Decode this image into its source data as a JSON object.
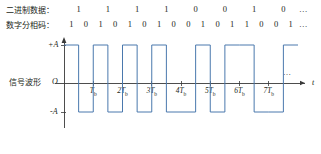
{
  "figure": {
    "title_row1_label": "二进制数据：",
    "title_row2_label": "数字分相码：",
    "waveform_label": "信号波形",
    "ellipsis": "…",
    "accent_color": "#4a78ad",
    "text_color": "#231f20"
  },
  "binary_data": {
    "label": "二进制数据：",
    "bits": [
      "1",
      "1",
      "1",
      "1",
      "0",
      "0",
      "1",
      "0"
    ],
    "trailing": "…"
  },
  "phase_code": {
    "label": "数字分相码：",
    "bits": [
      "1",
      "0",
      "1",
      "0",
      "1",
      "0",
      "1",
      "0",
      "0",
      "1",
      "0",
      "1",
      "1",
      "0",
      "0",
      "1"
    ],
    "trailing": "…"
  },
  "axes": {
    "origin_label": "O",
    "y_top_label": "+A",
    "y_bottom_label": "-A",
    "x_axis_label": "t",
    "x_ticks": [
      {
        "index": 1,
        "label": "T",
        "sub": "b"
      },
      {
        "index": 2,
        "label": "2T",
        "sub": "b"
      },
      {
        "index": 3,
        "label": "3T",
        "sub": "b"
      },
      {
        "index": 4,
        "label": "4T",
        "sub": "b"
      },
      {
        "index": 5,
        "label": "5T",
        "sub": "b"
      },
      {
        "index": 6,
        "label": "6T",
        "sub": "b"
      },
      {
        "index": 7,
        "label": "7T",
        "sub": "b"
      }
    ],
    "x_trailing": "…"
  },
  "chart_data": {
    "type": "line",
    "xlabel": "t",
    "ylabel": "",
    "ylim": [
      -1,
      1
    ],
    "y_tick_labels": [
      "+A",
      "O",
      "-A"
    ],
    "x_tick_labels": [
      "O",
      "Tb",
      "2Tb",
      "3Tb",
      "4Tb",
      "5Tb",
      "6Tb",
      "7Tb"
    ],
    "grid": false,
    "legend": "none",
    "bit_period": 1,
    "levels": {
      "high": "+A",
      "low": "-A"
    },
    "series": [
      {
        "name": "信号波形",
        "half_bit_levels": [
          1,
          -1,
          1,
          -1,
          1,
          -1,
          1,
          -1,
          -1,
          1,
          -1,
          1,
          1,
          -1,
          -1,
          1
        ],
        "steps": [
          {
            "t_start": 0.0,
            "t_end": 0.5,
            "level": 1
          },
          {
            "t_start": 0.5,
            "t_end": 1.0,
            "level": -1
          },
          {
            "t_start": 1.0,
            "t_end": 1.5,
            "level": 1
          },
          {
            "t_start": 1.5,
            "t_end": 2.0,
            "level": -1
          },
          {
            "t_start": 2.0,
            "t_end": 2.5,
            "level": 1
          },
          {
            "t_start": 2.5,
            "t_end": 3.0,
            "level": -1
          },
          {
            "t_start": 3.0,
            "t_end": 3.5,
            "level": 1
          },
          {
            "t_start": 3.5,
            "t_end": 4.0,
            "level": -1
          },
          {
            "t_start": 4.0,
            "t_end": 4.5,
            "level": -1
          },
          {
            "t_start": 4.5,
            "t_end": 5.0,
            "level": 1
          },
          {
            "t_start": 5.0,
            "t_end": 5.5,
            "level": -1
          },
          {
            "t_start": 5.5,
            "t_end": 6.0,
            "level": 1
          },
          {
            "t_start": 6.0,
            "t_end": 6.5,
            "level": 1
          },
          {
            "t_start": 6.5,
            "t_end": 7.0,
            "level": -1
          },
          {
            "t_start": 7.0,
            "t_end": 7.5,
            "level": -1
          },
          {
            "t_start": 7.5,
            "t_end": 8.0,
            "level": 1
          }
        ]
      }
    ],
    "annotations": [
      {
        "text": "二进制数据：1 1 1 1 0 0 1 0 …",
        "position": "above"
      },
      {
        "text": "数字分相码：1 0 1 0 1 0 1 0 0 1 0 1 1 0 0 1 …",
        "position": "above"
      },
      {
        "text": "信号波形",
        "position": "left"
      }
    ]
  }
}
